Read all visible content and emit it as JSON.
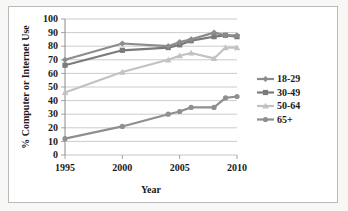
{
  "figure": {
    "name": "computer-internet-use-by-age-line-chart",
    "background_color": "#f7f7f5",
    "panel_color": "#ffffff",
    "border_color": "#b9b9b9"
  },
  "chart_data": {
    "type": "line",
    "title": "",
    "xlabel": "Year",
    "ylabel": "% Computer or Internet Use",
    "xlim": [
      1995,
      2010
    ],
    "ylim": [
      0,
      100
    ],
    "xticks": [
      1995,
      2000,
      2005,
      2010
    ],
    "yticks": [
      0,
      10,
      20,
      30,
      40,
      50,
      60,
      70,
      80,
      90,
      100
    ],
    "xtick_labels": [
      "1995",
      "2000",
      "2005",
      "2010"
    ],
    "ytick_labels": [
      "0",
      "10",
      "20",
      "30",
      "40",
      "50",
      "60",
      "70",
      "80",
      "90",
      "100"
    ],
    "grid": "horizontal",
    "legend_position": "right",
    "series": [
      {
        "name": "18-29",
        "color": "#8c8c8c",
        "marker": "diamond",
        "x": [
          1995,
          2000,
          2004,
          2005,
          2006,
          2008,
          2009,
          2010
        ],
        "values": [
          70,
          82,
          80,
          83,
          85,
          90,
          88,
          88
        ]
      },
      {
        "name": "30-49",
        "color": "#7a7a7a",
        "marker": "square",
        "x": [
          1995,
          2000,
          2004,
          2005,
          2006,
          2008,
          2009,
          2010
        ],
        "values": [
          66,
          77,
          79,
          81,
          84,
          87,
          88,
          87
        ]
      },
      {
        "name": "50-64",
        "color": "#c2c2c2",
        "marker": "triangle",
        "x": [
          1995,
          2000,
          2004,
          2005,
          2006,
          2008,
          2009,
          2010
        ],
        "values": [
          46,
          61,
          70,
          73,
          75,
          71,
          79,
          79
        ]
      },
      {
        "name": "65+",
        "color": "#8f8f8f",
        "marker": "circle",
        "x": [
          1995,
          2000,
          2004,
          2005,
          2006,
          2008,
          2009,
          2010
        ],
        "values": [
          12,
          21,
          30,
          32,
          35,
          35,
          42,
          43
        ]
      }
    ]
  },
  "legend": {
    "items": [
      {
        "label": "18-29",
        "color": "#8c8c8c",
        "marker": "diamond"
      },
      {
        "label": "30-49",
        "color": "#7a7a7a",
        "marker": "square"
      },
      {
        "label": "50-64",
        "color": "#c2c2c2",
        "marker": "triangle"
      },
      {
        "label": "65+",
        "color": "#8f8f8f",
        "marker": "circle"
      }
    ]
  }
}
